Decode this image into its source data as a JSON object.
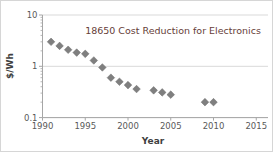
{
  "chart_data": {
    "type": "scatter",
    "title": "18650 Cost Reduction for Electronics",
    "xlabel": "Year",
    "ylabel": "$/Wh",
    "y_scale": "log",
    "xlim": [
      1990,
      2016.5
    ],
    "ylim": [
      0.1,
      10
    ],
    "x_ticks": [
      "1990",
      "1995",
      "2000",
      "2005",
      "2010",
      "2015"
    ],
    "y_ticks": [
      "10",
      "1",
      "0.1"
    ],
    "grid": "horizontal-major",
    "legend": "none",
    "marker": {
      "shape": "diamond",
      "size": 7.5
    },
    "series": [
      {
        "name": "18650 cell cost",
        "points": [
          [
            1991,
            3.0
          ],
          [
            1992,
            2.5
          ],
          [
            1993,
            2.1
          ],
          [
            1994,
            1.85
          ],
          [
            1995,
            1.75
          ],
          [
            1996,
            1.3
          ],
          [
            1997,
            0.95
          ],
          [
            1998,
            0.6
          ],
          [
            1999,
            0.5
          ],
          [
            2000,
            0.43
          ],
          [
            2001,
            0.36
          ],
          [
            2003,
            0.34
          ],
          [
            2004,
            0.31
          ],
          [
            2005,
            0.28
          ],
          [
            2009,
            0.2
          ],
          [
            2010,
            0.2
          ]
        ]
      }
    ],
    "colors": {
      "marker": "#7f7f7f",
      "marker_edge": "#6e6e6e",
      "title_text": "#664038",
      "axis_text": "#595959",
      "axis_line": "#a6a6a6",
      "gridline": "#d9d9d9",
      "background": "#ffffff"
    }
  }
}
